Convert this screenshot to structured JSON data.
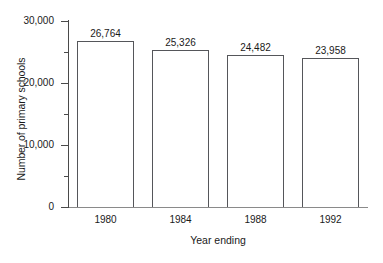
{
  "chart_data": {
    "type": "bar",
    "title": "",
    "subtitle": "",
    "xlabel": "Year ending",
    "ylabel": "Number of primary schools",
    "categories": [
      "1980",
      "1984",
      "1988",
      "1992"
    ],
    "values": [
      26764,
      25326,
      24482,
      23958
    ],
    "value_labels": [
      "26,764",
      "25,326",
      "24,482",
      "23,958"
    ],
    "ylim": [
      0,
      30000
    ],
    "y_major_ticks": [
      0,
      10000,
      20000,
      30000
    ],
    "y_major_tick_labels": [
      "0",
      "10,000",
      "20,000",
      "30,000"
    ],
    "y_minor_ticks": [
      5000,
      15000,
      25000
    ],
    "grid": false,
    "legend": false,
    "legend_position": "none",
    "bar_fill_color": "#ffffff",
    "bar_stroke_color": "#55565a",
    "axis_color": "#4a4a4a",
    "text_color": "#1a1a1a"
  }
}
